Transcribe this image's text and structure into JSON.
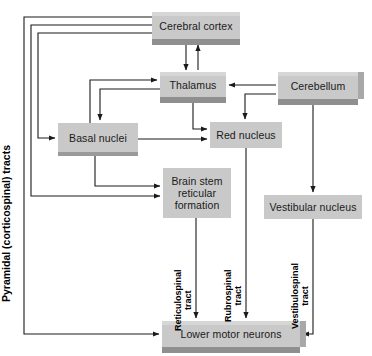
{
  "diagram": {
    "width": 372,
    "height": 356,
    "colors": {
      "box_fill": "#c9c9c9",
      "box_shadow": "#9a9a9a",
      "box_side": "#a8a8a8",
      "box_bottom": "#8f8f8f",
      "box_top_bevel": "#d6d6d6",
      "line": "#1a1a1a",
      "text": "#1a1a1a",
      "background": "#ffffff"
    }
  },
  "nodes": {
    "cerebral_cortex": {
      "label": "Cerebral cortex",
      "x": 152,
      "y": 12,
      "w": 88,
      "h": 27,
      "style": "slab"
    },
    "thalamus": {
      "label": "Thalamus",
      "x": 160,
      "y": 72,
      "w": 66,
      "h": 25,
      "style": "slab"
    },
    "cerebellum": {
      "label": "Cerebellum",
      "x": 278,
      "y": 72,
      "w": 80,
      "h": 27,
      "style": "slab"
    },
    "basal_nuclei": {
      "label": "Basal nuclei",
      "x": 58,
      "y": 123,
      "w": 80,
      "h": 29,
      "style": "flat"
    },
    "red_nucleus": {
      "label": "Red nucleus",
      "x": 210,
      "y": 122,
      "w": 72,
      "h": 26,
      "style": "flat"
    },
    "brain_stem": {
      "label": "Brain stem reticular formation",
      "line1": "Brain stem",
      "line2": "reticular",
      "line3": "formation",
      "x": 163,
      "y": 168,
      "w": 68,
      "h": 50,
      "style": "flat"
    },
    "vestibular_nucleus": {
      "label": "Vestibular nucleus",
      "x": 264,
      "y": 195,
      "w": 98,
      "h": 24,
      "style": "flat"
    },
    "lower_motor_neurons": {
      "label": "Lower motor neurons",
      "x": 162,
      "y": 321,
      "w": 138,
      "h": 26,
      "style": "slab"
    }
  },
  "labels": {
    "pyramidal_tract": "Pyramidal (corticospinal) tracts",
    "reticulospinal": {
      "line1": "Reticulospinal",
      "line2": "tract"
    },
    "rubrospinal": {
      "line1": "Rubrospinal",
      "line2": "tract"
    },
    "vestibulospinal": {
      "line1": "Vestibulospinal",
      "line2": "tract"
    }
  },
  "connections": [
    {
      "name": "cortex-to-thalamus",
      "from": "cerebral_cortex",
      "to": "thalamus"
    },
    {
      "name": "thalamus-to-cortex",
      "from": "thalamus",
      "to": "cerebral_cortex"
    },
    {
      "name": "cortex-to-basal-nuclei",
      "from": "cerebral_cortex",
      "to": "basal_nuclei"
    },
    {
      "name": "cortex-to-brain-stem",
      "from": "cerebral_cortex",
      "to": "brain_stem"
    },
    {
      "name": "cortex-to-lower-motor-neurons",
      "from": "cerebral_cortex",
      "to": "lower_motor_neurons"
    },
    {
      "name": "basal-nuclei-to-thalamus",
      "from": "basal_nuclei",
      "to": "thalamus"
    },
    {
      "name": "thalamus-to-basal-nuclei",
      "from": "thalamus",
      "to": "basal_nuclei"
    },
    {
      "name": "basal-nuclei-to-red-nucleus",
      "from": "basal_nuclei",
      "to": "red_nucleus"
    },
    {
      "name": "basal-nuclei-to-brain-stem",
      "from": "basal_nuclei",
      "to": "brain_stem"
    },
    {
      "name": "thalamus-to-red-nucleus",
      "from": "thalamus",
      "to": "red_nucleus"
    },
    {
      "name": "cerebellum-to-thalamus",
      "from": "cerebellum",
      "to": "thalamus"
    },
    {
      "name": "cerebellum-to-red-nucleus",
      "from": "cerebellum",
      "to": "red_nucleus"
    },
    {
      "name": "cerebellum-to-vestibular",
      "from": "cerebellum",
      "to": "vestibular_nucleus"
    },
    {
      "name": "reticulospinal-tract",
      "from": "brain_stem",
      "to": "lower_motor_neurons"
    },
    {
      "name": "rubrospinal-tract",
      "from": "red_nucleus",
      "to": "lower_motor_neurons"
    },
    {
      "name": "vestibulospinal-tract",
      "from": "vestibular_nucleus",
      "to": "lower_motor_neurons"
    }
  ]
}
